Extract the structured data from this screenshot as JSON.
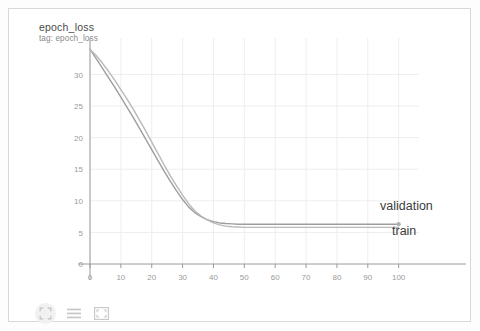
{
  "card": {
    "title": "epoch_loss",
    "subtitle": "tag: epoch_loss"
  },
  "toolbar": {
    "items": [
      {
        "name": "expand-icon",
        "label": "expand"
      },
      {
        "name": "lines-icon",
        "label": "data table"
      },
      {
        "name": "fit-icon",
        "label": "fit domain"
      }
    ]
  },
  "colors": {
    "card_border": "#d8d8d8",
    "grid": "#eeeeee",
    "axis": "#9a9a9a",
    "tick_text": "#9b9b9b",
    "title_text": "#4a4a4a",
    "subtitle_text": "#8a8a8a",
    "label_text": "#3c3c3c",
    "train_line": "#b9b9b9",
    "validation_line": "#9e9e9e",
    "marker": "#b0b0b0"
  },
  "chart_data": {
    "type": "line",
    "title": "epoch_loss",
    "subtitle": "tag: epoch_loss",
    "xlabel": "",
    "ylabel": "",
    "xlim": [
      0,
      104
    ],
    "ylim": [
      0,
      34.5
    ],
    "grid": true,
    "legend_position": "inline-right",
    "xticks": [
      0,
      10,
      20,
      30,
      40,
      50,
      60,
      70,
      80,
      90,
      100
    ],
    "yticks": [
      0,
      5,
      10,
      15,
      20,
      25,
      30
    ],
    "annotations": [
      {
        "text": "validation",
        "x": 100,
        "y": 6.8,
        "anchor": "above-right"
      },
      {
        "text": "train",
        "x": 100,
        "y": 6.0,
        "anchor": "below-right"
      }
    ],
    "x": [
      0,
      2,
      4,
      6,
      8,
      10,
      12,
      14,
      16,
      18,
      20,
      22,
      24,
      26,
      28,
      30,
      32,
      34,
      36,
      38,
      40,
      42,
      44,
      46,
      48,
      50,
      55,
      60,
      65,
      70,
      75,
      80,
      85,
      90,
      95,
      100
    ],
    "series": [
      {
        "name": "validation",
        "color": "#9e9e9e",
        "values": [
          34.0,
          32.5,
          31.0,
          29.5,
          28.0,
          26.4,
          24.8,
          23.2,
          21.5,
          19.8,
          18.1,
          16.4,
          14.7,
          13.1,
          11.6,
          10.2,
          9.0,
          8.1,
          7.5,
          7.0,
          6.7,
          6.5,
          6.4,
          6.35,
          6.3,
          6.3,
          6.3,
          6.3,
          6.3,
          6.3,
          6.3,
          6.3,
          6.3,
          6.3,
          6.3,
          6.3
        ]
      },
      {
        "name": "train",
        "color": "#b9b9b9",
        "values": [
          34.0,
          33.0,
          31.8,
          30.5,
          29.1,
          27.6,
          26.1,
          24.5,
          22.8,
          21.1,
          19.3,
          17.5,
          15.7,
          14.0,
          12.4,
          10.9,
          9.5,
          8.4,
          7.6,
          7.0,
          6.5,
          6.2,
          6.0,
          5.9,
          5.85,
          5.8,
          5.8,
          5.8,
          5.8,
          5.8,
          5.8,
          5.8,
          5.8,
          5.8,
          5.8,
          5.8
        ]
      }
    ],
    "end_marker": {
      "x": 100,
      "y": 6.3
    }
  }
}
